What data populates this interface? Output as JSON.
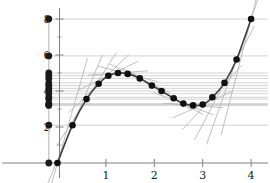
{
  "chart_data": {
    "type": "line",
    "title": "",
    "subtitle": "",
    "xlabel": "",
    "ylabel": "",
    "xlim": [
      -0.25,
      4.35
    ],
    "ylim": [
      -0.55,
      8.9
    ],
    "grid": false,
    "legend": null,
    "axis_color": "#808080",
    "curve_color": "#404040",
    "point_color": "#101010",
    "tangent_color": "#b4b4b4",
    "rug_line_color": "#c8c8c8",
    "rug_point_color": "#1a1a1a",
    "background": "#ffffff",
    "x_ticks": [
      {
        "value": 1,
        "label": "1"
      },
      {
        "value": 2,
        "label": "2"
      },
      {
        "value": 3,
        "label": "3"
      },
      {
        "value": 4,
        "label": "4"
      }
    ],
    "y_ticks": [
      {
        "value": 2,
        "label": "2"
      },
      {
        "value": 4,
        "label": "4"
      },
      {
        "value": 6,
        "label": "6"
      },
      {
        "value": 8,
        "label": "8"
      }
    ],
    "y_minor_ticks": [
      1,
      3,
      5,
      7
    ],
    "series": [
      {
        "name": "curve",
        "x": [
          0.0,
          0.31,
          0.6,
          0.85,
          1.05,
          1.25,
          1.45,
          1.7,
          1.95,
          2.15,
          2.4,
          2.6,
          2.8,
          3.0,
          3.2,
          3.45,
          3.7,
          4.0
        ],
        "y": [
          0.0,
          2.1,
          3.55,
          4.4,
          4.85,
          5.0,
          4.95,
          4.7,
          4.3,
          4.0,
          3.6,
          3.3,
          3.2,
          3.25,
          3.65,
          4.45,
          5.75,
          8.0
        ]
      }
    ],
    "tangent_slopes": [
      9.4,
      6.3,
      4.2,
      2.6,
      1.3,
      0.2,
      -0.7,
      -1.3,
      -1.6,
      -1.7,
      -1.5,
      -1.0,
      -0.2,
      1.2,
      2.9,
      5.1,
      7.6,
      10.4
    ],
    "tangent_half_length": 0.62,
    "rug_x_position": -0.18,
    "rug_values": [
      8.0,
      5.95,
      5.0,
      4.85,
      4.7,
      4.45,
      4.3,
      4.15,
      4.0,
      3.85,
      3.65,
      3.55,
      3.3,
      3.25,
      3.2,
      2.1,
      0.0
    ],
    "rug_marker_radius": 3.4
  }
}
